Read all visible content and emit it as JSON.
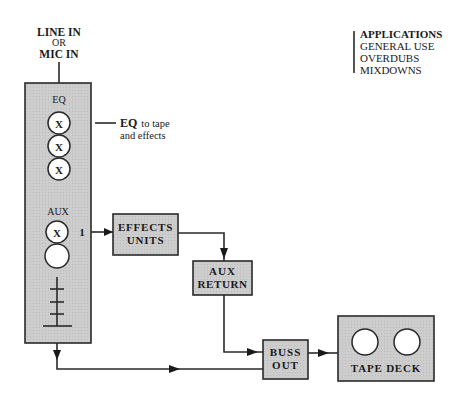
{
  "diagram": {
    "input_label": [
      "LINE IN",
      "OR",
      "MIC IN"
    ],
    "channel_strip": {
      "eq_label": "EQ",
      "eq_knobs": [
        "X",
        "X",
        "X"
      ],
      "aux_label": "AUX",
      "aux_knobs": [
        "X",
        ""
      ],
      "aux_send_number": "1",
      "fader": "fader"
    },
    "eq_annotation": {
      "bold": "EQ",
      "line1_rest": "to tape",
      "line2": "and effects"
    },
    "boxes": {
      "effects_units": [
        "EFFECTS",
        "UNITS"
      ],
      "aux_return": [
        "AUX",
        "RETURN"
      ],
      "buss_out": [
        "BUSS",
        "OUT"
      ],
      "tape_deck": "TAPE DECK"
    },
    "applications": {
      "title": "APPLICATIONS",
      "items": [
        "GENERAL USE",
        "OVERDUBS",
        "MIXDOWNS"
      ]
    },
    "colors": {
      "box_fill": "#c9c9c9",
      "stroke": "#2a2a2a",
      "background": "#ffffff"
    },
    "connections": [
      {
        "from": "input",
        "to": "channel_strip"
      },
      {
        "from": "aux_send_1",
        "to": "effects_units"
      },
      {
        "from": "effects_units",
        "to": "aux_return"
      },
      {
        "from": "aux_return",
        "to": "buss_out"
      },
      {
        "from": "channel_strip",
        "to": "buss_out"
      },
      {
        "from": "buss_out",
        "to": "tape_deck"
      }
    ]
  }
}
